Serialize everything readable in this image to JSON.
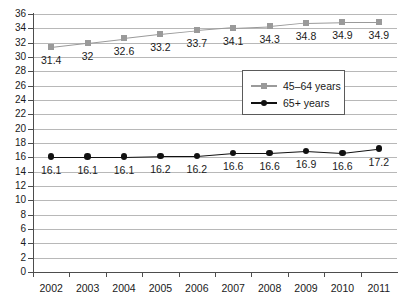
{
  "chart_data": {
    "type": "line",
    "title": "",
    "subtitle": "",
    "xlabel": "",
    "ylabel": "",
    "categories": [
      "2002",
      "2003",
      "2004",
      "2005",
      "2006",
      "2007",
      "2008",
      "2009",
      "2010",
      "2011"
    ],
    "ylim": [
      0,
      36
    ],
    "ytick_step": 2,
    "yticks": [
      "36",
      "34",
      "32",
      "30",
      "28",
      "26",
      "24",
      "22",
      "20",
      "18",
      "16",
      "14",
      "12",
      "10",
      "8",
      "6",
      "4",
      "2",
      "0"
    ],
    "grid": true,
    "grid_axis": "y",
    "legend_position": "upper-right-inside",
    "series": [
      {
        "name": "45–64 years",
        "color": "#9a9a9a",
        "marker": "square",
        "values": [
          31.4,
          32,
          32.6,
          33.2,
          33.7,
          34.1,
          34.3,
          34.8,
          34.9,
          34.9
        ],
        "labels": [
          "31.4",
          "32",
          "32.6",
          "33.2",
          "33.7",
          "34.1",
          "34.3",
          "34.8",
          "34.9",
          "34.9"
        ]
      },
      {
        "name": "65+ years",
        "color": "#111111",
        "marker": "circle",
        "values": [
          16.1,
          16.1,
          16.1,
          16.2,
          16.2,
          16.6,
          16.6,
          16.9,
          16.6,
          17.2
        ],
        "labels": [
          "16.1",
          "16.1",
          "16.1",
          "16.2",
          "16.2",
          "16.6",
          "16.6",
          "16.9",
          "16.6",
          "17.2"
        ]
      }
    ]
  },
  "legend": {
    "entries": [
      {
        "label": "45–64 years"
      },
      {
        "label": "65+ years"
      }
    ]
  }
}
